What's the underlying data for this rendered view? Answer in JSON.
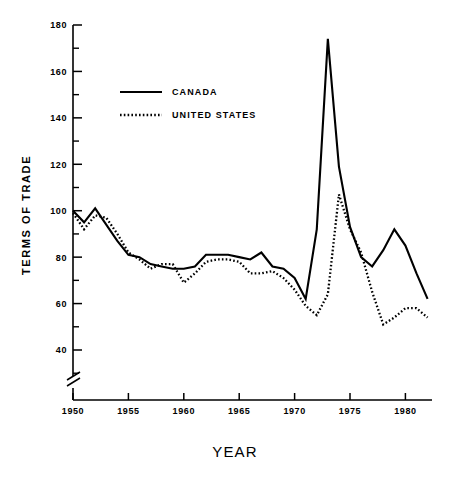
{
  "chart_data": {
    "type": "line",
    "title": "",
    "xlabel": "YEAR",
    "ylabel": "TERMS OF TRADE",
    "xlim": [
      1950,
      1982
    ],
    "ylim": [
      30,
      180
    ],
    "y_axis_break": true,
    "grid": false,
    "legend_position": "upper-left-inside",
    "x_major_ticks": [
      1950,
      1955,
      1960,
      1965,
      1970,
      1975,
      1980
    ],
    "x_tick_labels": [
      "1950",
      "1955",
      "1960",
      "1965",
      "1970",
      "1975",
      "1980"
    ],
    "y_major_ticks": [
      40,
      60,
      80,
      100,
      120,
      140,
      160,
      180
    ],
    "y_tick_labels": [
      "40",
      "60",
      "80",
      "100",
      "120",
      "140",
      "160",
      "180"
    ],
    "y_minor_ticks": [
      30,
      50,
      70,
      90,
      110,
      130,
      150,
      170
    ],
    "x": [
      1950,
      1951,
      1952,
      1953,
      1954,
      1955,
      1956,
      1957,
      1958,
      1959,
      1960,
      1961,
      1962,
      1963,
      1964,
      1965,
      1966,
      1967,
      1968,
      1969,
      1970,
      1971,
      1972,
      1973,
      1974,
      1975,
      1976,
      1977,
      1978,
      1979,
      1980,
      1981,
      1982
    ],
    "series": [
      {
        "name": "CANADA",
        "style": "solid",
        "color": "#000000",
        "values": [
          100,
          95,
          101,
          94,
          87,
          81,
          80,
          77,
          76,
          75,
          75,
          76,
          81,
          81,
          81,
          80,
          79,
          82,
          76,
          75,
          71,
          62,
          92,
          174,
          119,
          93,
          80,
          76,
          83,
          92,
          85,
          73,
          62
        ]
      },
      {
        "name": "UNITED STATES",
        "style": "dotted",
        "color": "#000000",
        "values": [
          99,
          92,
          98,
          97,
          90,
          82,
          79,
          75,
          77,
          77,
          69,
          73,
          78,
          79,
          79,
          78,
          73,
          73,
          74,
          71,
          66,
          59,
          55,
          64,
          107,
          92,
          82,
          65,
          51,
          54,
          58,
          58,
          54
        ]
      }
    ],
    "legend": [
      {
        "label": "CANADA",
        "style": "solid"
      },
      {
        "label": "UNITED STATES",
        "style": "dotted"
      }
    ]
  }
}
